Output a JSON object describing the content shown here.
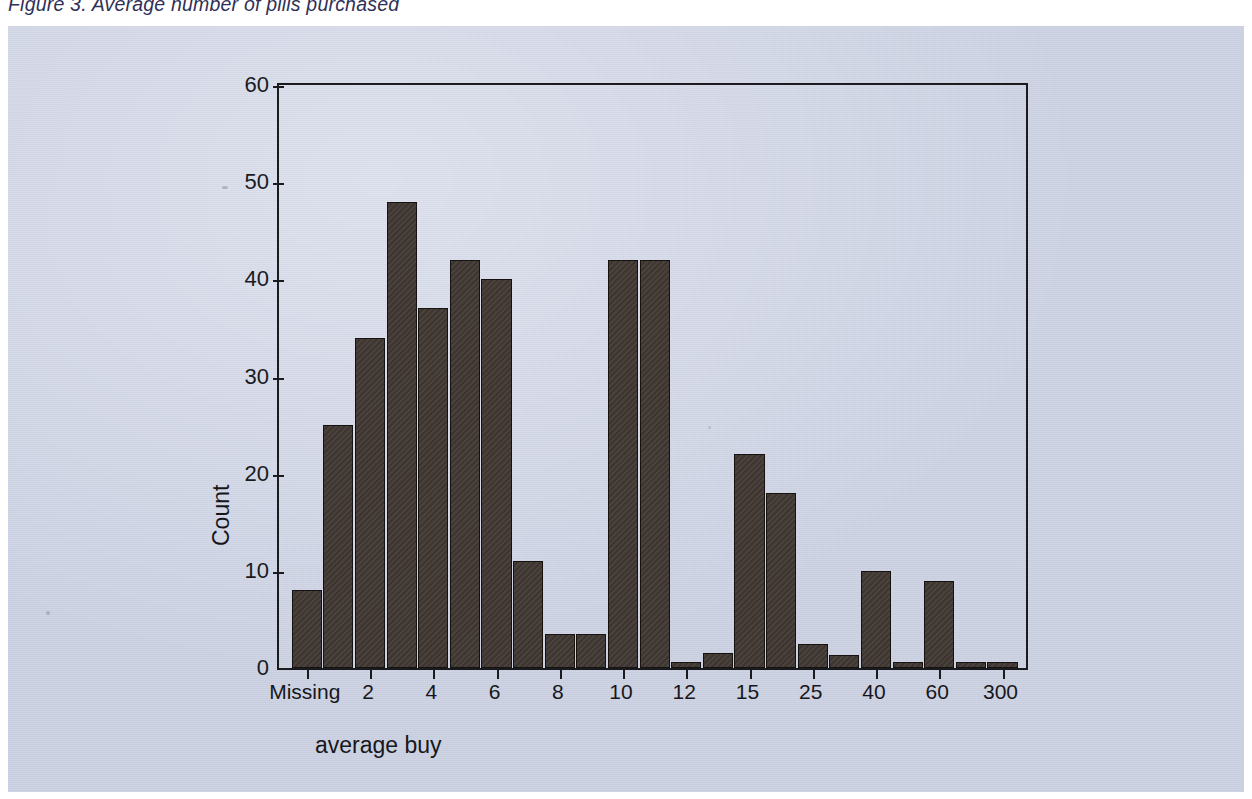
{
  "figure": {
    "caption": "Figure 3. Average number of pills purchased"
  },
  "chart_data": {
    "type": "bar",
    "title": "Figure 3. Average number of pills purchased",
    "xlabel": "average buy",
    "ylabel": "Count",
    "ylim": [
      0,
      60
    ],
    "ytick_labels": [
      "0",
      "10",
      "20",
      "30",
      "40",
      "50",
      "60"
    ],
    "ytick_values": [
      0,
      10,
      20,
      30,
      40,
      50,
      60
    ],
    "xtick_labels": [
      "Missing",
      "2",
      "4",
      "6",
      "8",
      "10",
      "12",
      "15",
      "25",
      "40",
      "60",
      "300"
    ],
    "grid": false,
    "legend": "none",
    "bar_color": "#413833",
    "plot_background": "#ccd2e4",
    "categories": [
      "Missing",
      "1",
      "2",
      "3",
      "4",
      "5",
      "6",
      "7",
      "8",
      "9",
      "10",
      "11",
      "12",
      "13",
      "14",
      "15",
      "20",
      "25",
      "30",
      "40",
      "50",
      "60",
      "300"
    ],
    "values": [
      8,
      25,
      34,
      48,
      37,
      42,
      40,
      11,
      3.5,
      3.5,
      42,
      42,
      0.5,
      1.5,
      22,
      18,
      2.5,
      1.3,
      10,
      0.5,
      9,
      0.5,
      0.5
    ],
    "bars": [
      {
        "label": "Missing",
        "value": 8
      },
      {
        "label": "1",
        "value": 25
      },
      {
        "label": "2",
        "value": 34
      },
      {
        "label": "3",
        "value": 48
      },
      {
        "label": "4",
        "value": 37
      },
      {
        "label": "5",
        "value": 42
      },
      {
        "label": "6",
        "value": 40
      },
      {
        "label": "7",
        "value": 11
      },
      {
        "label": "8",
        "value": 3.5
      },
      {
        "label": "9",
        "value": 3.5
      },
      {
        "label": "10",
        "value": 42
      },
      {
        "label": "11",
        "value": 42
      },
      {
        "label": "12",
        "value": 0.5
      },
      {
        "label": "13",
        "value": 1.5
      },
      {
        "label": "14",
        "value": 22
      },
      {
        "label": "15",
        "value": 18
      },
      {
        "label": "20",
        "value": 2.5
      },
      {
        "label": "25",
        "value": 1.3
      },
      {
        "label": "30",
        "value": 10
      },
      {
        "label": "40",
        "value": 0.5
      },
      {
        "label": "50",
        "value": 9
      },
      {
        "label": "60",
        "value": 0.5
      },
      {
        "label": "300",
        "value": 0.5
      }
    ]
  }
}
